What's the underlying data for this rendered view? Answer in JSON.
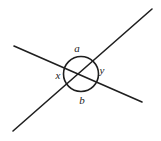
{
  "figure": {
    "kind": "geometry-diagram",
    "background_color": "#ffffff",
    "stroke_color": "#1f1f1f",
    "label_color": "#1b1b1b",
    "width": 161,
    "height": 141
  },
  "chart_data": {
    "type": "diagram",
    "title": "",
    "xlabel": "",
    "ylabel": "",
    "intersection_point": {
      "x": 80,
      "y": 76
    },
    "lines": [
      {
        "name": "line-upper-left-to-lower-right",
        "x1": 14,
        "y1": 46,
        "x2": 142,
        "y2": 102,
        "stroke": "#1f1f1f",
        "stroke_width": 1.6
      },
      {
        "name": "line-lower-left-to-upper-right",
        "x1": 13,
        "y1": 131,
        "x2": 152,
        "y2": 9,
        "stroke": "#1f1f1f",
        "stroke_width": 1.6
      }
    ],
    "circle": {
      "name": "angle-circle",
      "cx": 81,
      "cy": 74,
      "r": 17.5,
      "stroke": "#1f1f1f",
      "stroke_width": 1.6,
      "fill": "none"
    },
    "labels": [
      {
        "id": "a",
        "text": "a",
        "x": 77,
        "y": 48,
        "position": "top"
      },
      {
        "id": "x",
        "text": "x",
        "x": 58,
        "y": 75,
        "position": "left"
      },
      {
        "id": "y",
        "text": "y",
        "x": 102,
        "y": 70,
        "position": "right"
      },
      {
        "id": "b",
        "text": "b",
        "x": 82,
        "y": 100,
        "position": "bottom"
      }
    ]
  }
}
